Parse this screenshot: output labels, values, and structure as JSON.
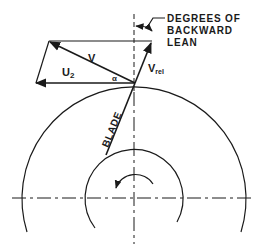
{
  "diagram": {
    "type": "velocity-triangle",
    "labels": {
      "annotation_line1": "DEGREES OF",
      "annotation_line2": "BACKWARD",
      "annotation_line3": "LEAN",
      "absolute_velocity": "V",
      "tip_speed_main": "U",
      "tip_speed_sub": "2",
      "relative_velocity_main": "V",
      "relative_velocity_sub": "rel",
      "angle": "α",
      "blade": "BLADE"
    },
    "rotation_direction": "counter-clockwise",
    "ink_color": "#1a1a1a",
    "background_color": "#ffffff"
  }
}
